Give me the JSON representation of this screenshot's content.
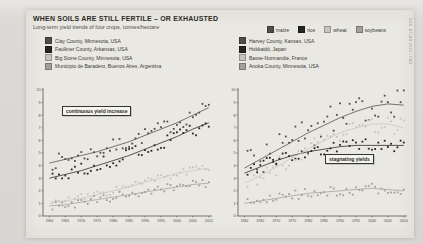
{
  "header": {
    "title": "WHEN SOILS ARE STILL FERTILE – OR EXHAUSTED",
    "subtitle": "Long-term yield trends of four crops, tonnes/hectare"
  },
  "crop_legend": [
    {
      "label": "maize",
      "color": "#4f4e49"
    },
    {
      "label": "rice",
      "color": "#262522"
    },
    {
      "label": "wheat",
      "color": "#c6c4bc"
    },
    {
      "label": "soybeans",
      "color": "#a3a098"
    }
  ],
  "left_legend": [
    {
      "label": "Clay County, Minnesota, USA",
      "color": "#4f4e49"
    },
    {
      "label": "Faulkner County, Arkansas, USA",
      "color": "#262522"
    },
    {
      "label": "Big Stone County, Minnesota, USA",
      "color": "#c6c4bc"
    },
    {
      "label": "Municipio de Baradero, Buenos Aires, Argentina",
      "color": "#a3a098"
    }
  ],
  "right_legend": [
    {
      "label": "Harvey County, Kansas, USA",
      "color": "#4f4e49"
    },
    {
      "label": "Hokkaidō, Japan",
      "color": "#262522"
    },
    {
      "label": "Basse-Normandie, France",
      "color": "#c6c4bc"
    },
    {
      "label": "Anoka County, Minnesota, USA",
      "color": "#a3a098"
    }
  ],
  "side_note": "SOIL ATLAS 2015 / FAO",
  "chart_data": [
    {
      "type": "scatter",
      "annotation": "continuous yield increase",
      "x": [
        1960,
        1965,
        1970,
        1975,
        1980,
        1985,
        1990,
        1995,
        2000,
        2005,
        2010
      ],
      "yticks": [
        0,
        1,
        2,
        3,
        4,
        5,
        6,
        7,
        8,
        9,
        10
      ],
      "ylim": [
        0,
        10
      ],
      "xlabel": "",
      "ylabel": "tonnes/hectare",
      "series": [
        {
          "name": "Clay County, Minnesota, USA (maize)",
          "color": "#4f4e49",
          "spread": 0.6,
          "values": [
            4.2,
            4.5,
            4.8,
            5.1,
            5.5,
            5.9,
            6.4,
            6.9,
            7.4,
            8.0,
            8.6
          ]
        },
        {
          "name": "Faulkner County, Arkansas, USA (rice)",
          "color": "#262522",
          "spread": 0.6,
          "values": [
            3.0,
            3.3,
            3.6,
            4.0,
            4.4,
            4.8,
            5.3,
            5.8,
            6.3,
            6.9,
            7.4
          ]
        },
        {
          "name": "Big Stone County, Minnesota, USA (wheat)",
          "color": "#c6c4bc",
          "spread": 0.35,
          "values": [
            1.0,
            1.2,
            1.4,
            1.7,
            2.0,
            2.3,
            2.7,
            3.0,
            3.4,
            3.6,
            3.8
          ]
        },
        {
          "name": "Municipio de Baradero, Buenos Aires, Argentina (soybeans)",
          "color": "#a3a098",
          "spread": 0.35,
          "values": [
            0.8,
            0.9,
            1.1,
            1.3,
            1.5,
            1.7,
            1.9,
            2.1,
            2.3,
            2.5,
            2.6
          ]
        }
      ]
    },
    {
      "type": "scatter",
      "annotation": "stagnating yields",
      "x": [
        1960,
        1965,
        1970,
        1975,
        1980,
        1985,
        1990,
        1995,
        2000,
        2005,
        2010
      ],
      "yticks": [
        0,
        1,
        2,
        3,
        4,
        5,
        6,
        7,
        8,
        9,
        10
      ],
      "ylim": [
        0,
        10
      ],
      "xlabel": "",
      "ylabel": "tonnes/hectare",
      "series": [
        {
          "name": "Harvey County, Kansas, USA (maize)",
          "color": "#4f4e49",
          "spread": 1.25,
          "values": [
            3.8,
            4.5,
            5.2,
            5.9,
            6.6,
            7.2,
            7.8,
            8.3,
            8.7,
            8.9,
            8.8
          ]
        },
        {
          "name": "Hokkaidō, Japan (rice)",
          "color": "#262522",
          "spread": 0.5,
          "values": [
            3.4,
            3.9,
            4.4,
            4.8,
            5.1,
            5.3,
            5.5,
            5.6,
            5.6,
            5.6,
            5.6
          ]
        },
        {
          "name": "Basse-Normandie, France (wheat)",
          "color": "#c6c4bc",
          "spread": 0.7,
          "values": [
            2.6,
            3.2,
            3.9,
            4.6,
            5.3,
            6.0,
            6.6,
            7.0,
            7.3,
            7.3,
            7.0
          ]
        },
        {
          "name": "Anoka County, Minnesota, USA (soybeans)",
          "color": "#a3a098",
          "spread": 0.4,
          "values": [
            1.0,
            1.2,
            1.4,
            1.6,
            1.8,
            1.9,
            2.0,
            2.1,
            2.2,
            2.1,
            2.0
          ]
        }
      ]
    }
  ]
}
